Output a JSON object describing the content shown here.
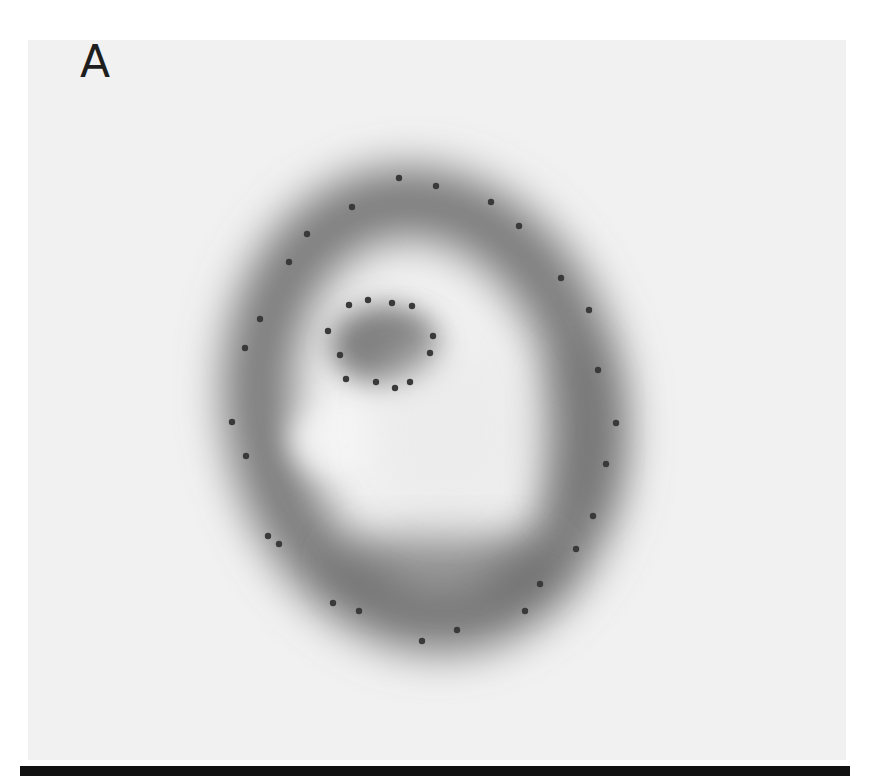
{
  "figure": {
    "panel_label": "A",
    "background_color": "#f1f1f1",
    "ring": {
      "center": [
        425,
        410
      ],
      "outer_radii": [
        185,
        230
      ],
      "inner_bright_spot": [
        335,
        440
      ],
      "dark_blob": [
        385,
        345
      ],
      "fill_color": "#6a6a6a"
    },
    "outer_markers": [
      [
        399,
        178
      ],
      [
        436,
        186
      ],
      [
        491,
        202
      ],
      [
        352,
        207
      ],
      [
        519,
        226
      ],
      [
        307,
        234
      ],
      [
        561,
        278
      ],
      [
        289,
        262
      ],
      [
        589,
        310
      ],
      [
        260,
        319
      ],
      [
        245,
        348
      ],
      [
        598,
        370
      ],
      [
        616,
        423
      ],
      [
        232,
        422
      ],
      [
        246,
        456
      ],
      [
        606,
        464
      ],
      [
        593,
        516
      ],
      [
        268,
        536
      ],
      [
        279,
        544
      ],
      [
        576,
        549
      ],
      [
        540,
        584
      ],
      [
        333,
        603
      ],
      [
        359,
        611
      ],
      [
        525,
        611
      ],
      [
        457,
        630
      ],
      [
        422,
        641
      ]
    ],
    "inner_markers": [
      [
        349,
        305
      ],
      [
        368,
        300
      ],
      [
        392,
        303
      ],
      [
        412,
        306
      ],
      [
        328,
        331
      ],
      [
        433,
        336
      ],
      [
        340,
        355
      ],
      [
        430,
        353
      ],
      [
        346,
        379
      ],
      [
        376,
        382
      ],
      [
        395,
        388
      ],
      [
        410,
        382
      ]
    ],
    "marker_color": "#3a3a3a"
  }
}
